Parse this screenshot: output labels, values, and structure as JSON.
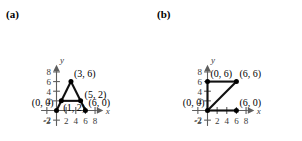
{
  "figure": {
    "width": 302,
    "height": 141,
    "background": "#ffffff",
    "line_color": "#111111",
    "axis_color": "#5d5d5d"
  },
  "panels": [
    {
      "id": "a",
      "label": "(a)",
      "axes": {
        "x_name": "x",
        "y_name": "y",
        "x_ticks": [
          "-2",
          "2",
          "4",
          "6",
          "8"
        ],
        "x_tick_values": [
          -2,
          2,
          4,
          6,
          8
        ],
        "y_ticks": [
          "8",
          "6",
          "4",
          "2",
          "-2"
        ],
        "y_tick_values": [
          8,
          6,
          4,
          2,
          -2
        ],
        "xlim": [
          -3.2,
          9.4
        ],
        "ylim": [
          -3.2,
          9.4
        ]
      },
      "point_labels": [
        {
          "text": "(3, 6)",
          "x": 3,
          "y": 6,
          "anchor": "above-right"
        },
        {
          "text": "(5, 2)",
          "x": 5,
          "y": 2,
          "anchor": "right"
        },
        {
          "text": "(0, 0)",
          "x": 0,
          "y": 0,
          "anchor": "left-above"
        },
        {
          "text": "(1, 2)",
          "x": 1,
          "y": 2,
          "anchor": "below-right"
        },
        {
          "text": "(6, 0)",
          "x": 6,
          "y": 0,
          "anchor": "above-right"
        }
      ],
      "shapes": [
        {
          "name": "triangle-left-side",
          "points": [
            [
              0,
              0
            ],
            [
              3,
              6
            ]
          ]
        },
        {
          "name": "triangle-right-side",
          "points": [
            [
              3,
              6
            ],
            [
              6,
              0
            ]
          ]
        },
        {
          "name": "midsegment",
          "points": [
            [
              1,
              2
            ],
            [
              5,
              2
            ]
          ]
        }
      ],
      "vertices": [
        [
          0,
          0
        ],
        [
          3,
          6
        ],
        [
          6,
          0
        ],
        [
          1,
          2
        ],
        [
          5,
          2
        ]
      ]
    },
    {
      "id": "b",
      "label": "(b)",
      "axes": {
        "x_name": "x",
        "y_name": "y",
        "x_ticks": [
          "-2",
          "2",
          "4",
          "6",
          "8"
        ],
        "x_tick_values": [
          -2,
          2,
          4,
          6,
          8
        ],
        "y_ticks": [
          "8",
          "6",
          "4",
          "2",
          "-2"
        ],
        "y_tick_values": [
          8,
          6,
          4,
          2,
          -2
        ],
        "xlim": [
          -3.2,
          9.4
        ],
        "ylim": [
          -3.2,
          9.4
        ]
      },
      "point_labels": [
        {
          "text": "(0, 6)",
          "x": 0,
          "y": 6,
          "anchor": "above-right"
        },
        {
          "text": "(6, 6)",
          "x": 6,
          "y": 6,
          "anchor": "above-right"
        },
        {
          "text": "(0, 0)",
          "x": 0,
          "y": 0,
          "anchor": "left-above"
        },
        {
          "text": "(6, 0)",
          "x": 6,
          "y": 0,
          "anchor": "above-right"
        }
      ],
      "shapes": [
        {
          "name": "top-side",
          "points": [
            [
              0,
              6
            ],
            [
              6,
              6
            ]
          ]
        },
        {
          "name": "left-side",
          "points": [
            [
              0,
              0
            ],
            [
              0,
              6
            ]
          ]
        },
        {
          "name": "hypotenuse",
          "points": [
            [
              0,
              0
            ],
            [
              6,
              6
            ]
          ]
        },
        {
          "name": "bottom-side",
          "points": [
            [
              0,
              0
            ],
            [
              6,
              0
            ]
          ]
        }
      ],
      "vertices": [
        [
          0,
          6
        ],
        [
          6,
          6
        ],
        [
          0,
          0
        ],
        [
          6,
          0
        ]
      ]
    }
  ]
}
